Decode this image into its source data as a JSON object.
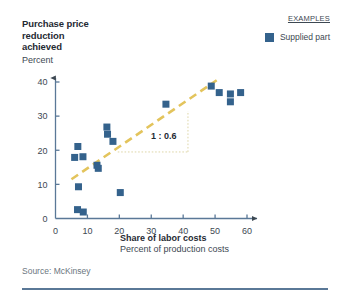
{
  "title": {
    "lines": [
      "Purchase price",
      "reduction",
      "achieved"
    ],
    "unit": "Percent"
  },
  "legend": {
    "header": "EXAMPLES",
    "items": [
      {
        "label": "Supplied part",
        "color": "#34628c",
        "marker": "square"
      }
    ]
  },
  "annotation": {
    "ratio": "1 : 0.6"
  },
  "source": "Source: McKinsey",
  "colors": {
    "marker": "#34628c",
    "axis": "#5a7897",
    "trend": "#e3c45c",
    "guide": "#ded6a8",
    "rule": "#5a7897",
    "text": "#3d4852"
  },
  "chart_data": {
    "type": "scatter",
    "title": "Purchase price reduction achieved",
    "xlabel": "Share of labor costs",
    "xlabel_sub": "Percent of production costs",
    "ylabel": "Percent",
    "xlim": [
      0,
      60
    ],
    "ylim": [
      0,
      40
    ],
    "xticks": [
      0,
      10,
      20,
      30,
      40,
      50,
      60
    ],
    "yticks": [
      0,
      10,
      20,
      30,
      40
    ],
    "grid": false,
    "legend_position": "top-right",
    "series": [
      {
        "name": "Supplied part",
        "color": "#34628c",
        "points": [
          {
            "x": 6.0,
            "y": 17.9
          },
          {
            "x": 7.0,
            "y": 21.1
          },
          {
            "x": 7.2,
            "y": 9.3
          },
          {
            "x": 6.9,
            "y": 2.6
          },
          {
            "x": 8.7,
            "y": 1.9
          },
          {
            "x": 8.6,
            "y": 18.1
          },
          {
            "x": 13.0,
            "y": 15.6
          },
          {
            "x": 13.4,
            "y": 14.7
          },
          {
            "x": 16.1,
            "y": 26.8
          },
          {
            "x": 16.3,
            "y": 24.7
          },
          {
            "x": 18.0,
            "y": 22.6
          },
          {
            "x": 20.3,
            "y": 7.6
          },
          {
            "x": 34.6,
            "y": 33.5
          },
          {
            "x": 48.8,
            "y": 38.8
          },
          {
            "x": 51.3,
            "y": 36.9
          },
          {
            "x": 54.8,
            "y": 36.5
          },
          {
            "x": 54.8,
            "y": 34.2
          },
          {
            "x": 58.0,
            "y": 36.9
          }
        ]
      }
    ],
    "trendline": {
      "style": "dashed",
      "color": "#e3c45c",
      "x_start": 5.0,
      "y_start": 11.5,
      "x_end": 50.5,
      "y_end": 40.5
    },
    "slope_guide": {
      "label": "1 : 0.6",
      "style": "dotted",
      "color": "#ded6a8",
      "x_left": 19.5,
      "x_right": 41.5,
      "y_bottom": 19.5,
      "y_top": 31.5
    }
  }
}
